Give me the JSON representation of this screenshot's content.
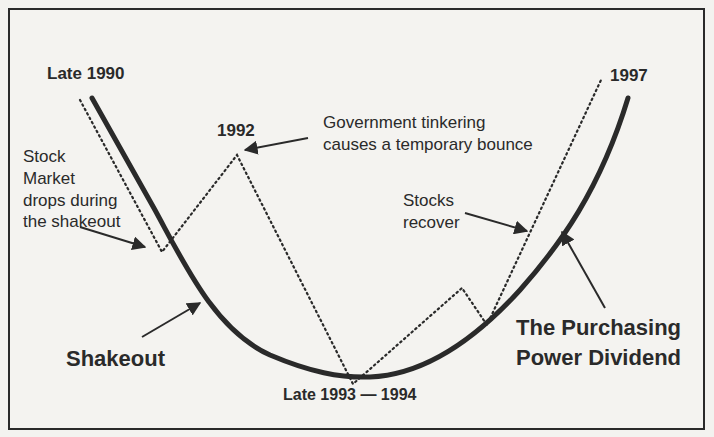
{
  "diagram": {
    "type": "u-curve-annotated",
    "labels": {
      "start": "Late 1990",
      "peak_1992": "1992",
      "end": "1997",
      "bottom": "Late 1993 — 1994",
      "government_line1": "Government tinkering",
      "government_line2": "causes a temporary bounce",
      "stock_line1": "Stock",
      "stock_line2": "Market",
      "stock_line3": "drops during",
      "stock_line4": "the shakeout",
      "stocks_recover_line1": "Stocks",
      "stocks_recover_line2": "recover",
      "shakeout": "Shakeout",
      "dividend_line1": "The Purchasing",
      "dividend_line2": "Power Dividend"
    },
    "series": [
      {
        "name": "economy-curve",
        "style": "solid-thick"
      },
      {
        "name": "stock-market",
        "style": "dotted"
      }
    ],
    "colors": {
      "ink": "#2a2a2a",
      "paper": "#f4f3f0"
    }
  }
}
